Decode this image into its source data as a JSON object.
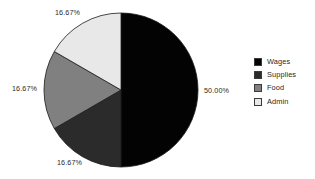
{
  "background_color": "#ffffff",
  "chart_data": {
    "type": "pie",
    "title": "",
    "labels": [
      "Wages",
      "Supplies",
      "Food",
      "Admin"
    ],
    "values": [
      50.0,
      16.67,
      16.67,
      16.67
    ],
    "value_labels": [
      "50.00%",
      "16.67%",
      "16.67%",
      "16.67%"
    ],
    "colors": [
      "#030303",
      "#2b2b2b",
      "#808080",
      "#e8e8e8"
    ],
    "units": "percent",
    "start_angle_deg": 0,
    "direction": "clockwise",
    "legend_position": "right",
    "grid": false,
    "geometry": {
      "center_x": 121,
      "center_y": 90,
      "radius": 77
    }
  },
  "slice_labels": {
    "wages": "50.00%",
    "supplies": "16.67%",
    "food": "16.67%",
    "admin": "16.67%"
  },
  "legend": {
    "items": [
      {
        "label": "Wages",
        "color": "#030303"
      },
      {
        "label": "Supplies",
        "color": "#2b2b2b"
      },
      {
        "label": "Food",
        "color": "#808080"
      },
      {
        "label": "Admin",
        "color": "#e8e8e8"
      }
    ]
  }
}
